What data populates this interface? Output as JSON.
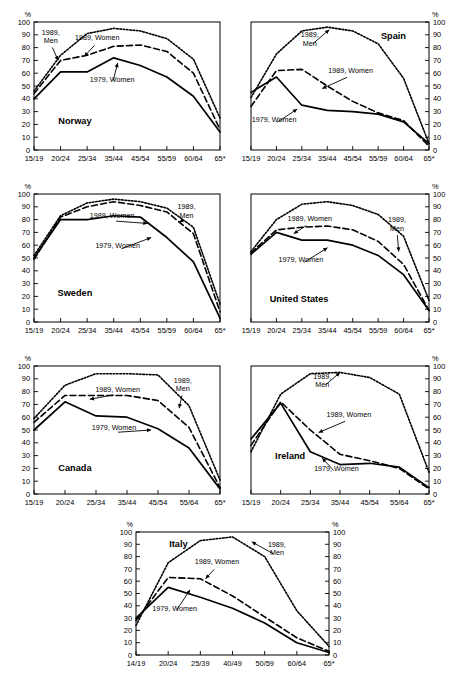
{
  "figure": {
    "axis_unit_label": "%",
    "yticks": [
      0,
      10,
      20,
      30,
      40,
      50,
      60,
      70,
      80,
      90,
      100
    ],
    "series_names": {
      "men_1989": "1989, Men",
      "women_1989": "1989, Women",
      "women_1979": "1979, Women"
    },
    "top_cut_text": ""
  },
  "chart_data": [
    {
      "type": "line",
      "title": "Norway",
      "xlabel": "",
      "ylabel": "%",
      "ylim": [
        0,
        100
      ],
      "grid": false,
      "legend_position": "inline-annotations",
      "categories": [
        "15/19",
        "20/24",
        "25/34",
        "35/44",
        "45/54",
        "55/59",
        "60/64",
        "65*"
      ],
      "series": [
        {
          "name": "1989, Men",
          "style": "dotted",
          "values": [
            46,
            74,
            91,
            95,
            93,
            87,
            71,
            25
          ]
        },
        {
          "name": "1989, Women",
          "style": "dashed",
          "values": [
            44,
            70,
            74,
            81,
            82,
            77,
            60,
            16
          ]
        },
        {
          "name": "1979, Women",
          "style": "solid",
          "values": [
            40,
            61,
            61,
            72,
            66,
            57,
            42,
            14
          ]
        }
      ],
      "annotations": [
        {
          "text": "1989,\nMen",
          "target": "men_1989"
        },
        {
          "text": "1989, Women",
          "target": "women_1989"
        },
        {
          "text": "1979, Women",
          "target": "women_1979"
        }
      ]
    },
    {
      "type": "line",
      "title": "Spain",
      "xlabel": "",
      "ylabel": "%",
      "ylim": [
        0,
        100
      ],
      "grid": false,
      "legend_position": "inline-annotations",
      "categories": [
        "15/19",
        "20/24",
        "25/34",
        "35/44",
        "45/54",
        "55/59",
        "60/64",
        "65*"
      ],
      "series": [
        {
          "name": "1989, Men",
          "style": "dotted",
          "values": [
            41,
            75,
            93,
            96,
            93,
            83,
            56,
            5
          ]
        },
        {
          "name": "1989, Women",
          "style": "dashed",
          "values": [
            34,
            62,
            63,
            50,
            38,
            29,
            23,
            3
          ]
        },
        {
          "name": "1979, Women",
          "style": "solid",
          "values": [
            45,
            57,
            35,
            31,
            30,
            28,
            22,
            5
          ]
        }
      ],
      "annotations": [
        {
          "text": "1989,\nMen",
          "target": "men_1989"
        },
        {
          "text": "1989, Women",
          "target": "women_1989"
        },
        {
          "text": "1979, Women",
          "target": "women_1979"
        }
      ]
    },
    {
      "type": "line",
      "title": "Sweden",
      "xlabel": "",
      "ylabel": "%",
      "ylim": [
        0,
        100
      ],
      "grid": false,
      "legend_position": "inline-annotations",
      "categories": [
        "15/19",
        "20/24",
        "25/34",
        "35/44",
        "45/54",
        "55/59",
        "60/64",
        "65*"
      ],
      "series": [
        {
          "name": "1989, Men",
          "style": "dotted",
          "values": [
            52,
            83,
            93,
            96,
            94,
            89,
            74,
            14
          ]
        },
        {
          "name": "1989, Women",
          "style": "dashed",
          "values": [
            49,
            82,
            90,
            94,
            91,
            86,
            69,
            8
          ]
        },
        {
          "name": "1979, Women",
          "style": "solid",
          "values": [
            50,
            80,
            80,
            83,
            82,
            66,
            47,
            3
          ]
        }
      ],
      "annotations": [
        {
          "text": "1989,\nMen",
          "target": "men_1989"
        },
        {
          "text": "1989, Women",
          "target": "women_1989"
        },
        {
          "text": "1979, Women",
          "target": "women_1979"
        }
      ]
    },
    {
      "type": "line",
      "title": "United States",
      "xlabel": "",
      "ylabel": "%",
      "ylim": [
        0,
        100
      ],
      "grid": false,
      "legend_position": "inline-annotations",
      "categories": [
        "15/19",
        "20/24",
        "25/34",
        "35/44",
        "45/54",
        "55/59",
        "60/64",
        "65*"
      ],
      "series": [
        {
          "name": "1989, Men",
          "style": "dotted",
          "values": [
            55,
            80,
            92,
            94,
            91,
            84,
            67,
            17
          ]
        },
        {
          "name": "1989, Women",
          "style": "dashed",
          "values": [
            54,
            72,
            74,
            75,
            72,
            63,
            45,
            9
          ]
        },
        {
          "name": "1979, Women",
          "style": "solid",
          "values": [
            53,
            70,
            64,
            64,
            60,
            52,
            37,
            9
          ]
        }
      ],
      "annotations": [
        {
          "text": "1989,\nMen",
          "target": "men_1989"
        },
        {
          "text": "1989, Women",
          "target": "women_1989"
        },
        {
          "text": "1979, Women",
          "target": "women_1979"
        }
      ]
    },
    {
      "type": "line",
      "title": "Canada",
      "xlabel": "",
      "ylabel": "%",
      "ylim": [
        0,
        100
      ],
      "grid": false,
      "legend_position": "inline-annotations",
      "categories": [
        "15/19",
        "20/24",
        "25/34",
        "35/44",
        "45/54",
        "55/64",
        "65*"
      ],
      "series": [
        {
          "name": "1989, Men",
          "style": "dotted",
          "values": [
            59,
            85,
            94,
            94,
            93,
            69,
            11
          ]
        },
        {
          "name": "1989, Women",
          "style": "dashed",
          "values": [
            56,
            77,
            77,
            77,
            73,
            52,
            5
          ]
        },
        {
          "name": "1979, Women",
          "style": "solid",
          "values": [
            50,
            72,
            61,
            60,
            51,
            36,
            4
          ]
        }
      ],
      "annotations": [
        {
          "text": "1989,\nMen",
          "target": "men_1989"
        },
        {
          "text": "1989, Women",
          "target": "women_1989"
        },
        {
          "text": "1979, Women",
          "target": "women_1979"
        }
      ]
    },
    {
      "type": "line",
      "title": "Ireland",
      "xlabel": "",
      "ylabel": "%",
      "ylim": [
        0,
        100
      ],
      "grid": false,
      "legend_position": "inline-annotations",
      "categories": [
        "15/19",
        "20/24",
        "25/34",
        "35/44",
        "45/54",
        "55/64",
        "65*"
      ],
      "series": [
        {
          "name": "1989, Men",
          "style": "dotted",
          "values": [
            33,
            78,
            94,
            95,
            91,
            78,
            17
          ]
        },
        {
          "name": "1989, Women",
          "style": "dashed",
          "values": [
            38,
            72,
            50,
            31,
            26,
            20,
            4
          ]
        },
        {
          "name": "1979, Women",
          "style": "solid",
          "values": [
            43,
            71,
            33,
            23,
            24,
            21,
            5
          ]
        }
      ],
      "annotations": [
        {
          "text": "1989,\nMen",
          "target": "men_1989"
        },
        {
          "text": "1989, Women",
          "target": "women_1989"
        },
        {
          "text": "1979, Women",
          "target": "women_1979"
        }
      ]
    },
    {
      "type": "line",
      "title": "Italy",
      "xlabel": "",
      "ylabel": "%",
      "ylim": [
        0,
        100
      ],
      "grid": false,
      "legend_position": "inline-annotations",
      "categories": [
        "14/19",
        "20/24",
        "25/39",
        "40/49",
        "50/59",
        "60/64",
        "65*"
      ],
      "series": [
        {
          "name": "1989, Men",
          "style": "dotted",
          "values": [
            24,
            75,
            93,
            96,
            80,
            36,
            7
          ]
        },
        {
          "name": "1989, Women",
          "style": "dashed",
          "values": [
            28,
            63,
            62,
            48,
            31,
            14,
            3
          ]
        },
        {
          "name": "1979, Women",
          "style": "solid",
          "values": [
            30,
            55,
            47,
            38,
            26,
            10,
            2
          ]
        }
      ],
      "annotations": [
        {
          "text": "1989,\nMen",
          "target": "men_1989"
        },
        {
          "text": "1989, Women",
          "target": "women_1989"
        },
        {
          "text": "1979, Women",
          "target": "women_1979"
        }
      ]
    }
  ]
}
